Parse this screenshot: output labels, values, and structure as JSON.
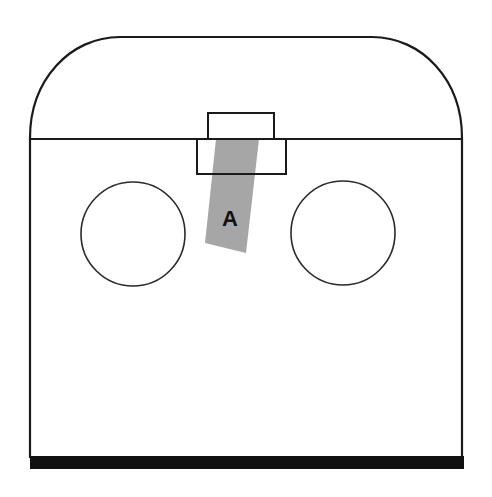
{
  "diagram": {
    "labels": {
      "region_a": "A"
    },
    "colors": {
      "stroke": "#1a1a1a",
      "shaded_region": "#a6a6a6",
      "base_bar": "#111111",
      "background": "#ffffff"
    },
    "elements": [
      "housing-outline",
      "divider-line",
      "upper-small-rectangle",
      "lower-rectangle",
      "shaded-band-a",
      "left-circle",
      "right-circle",
      "base-bar"
    ]
  }
}
